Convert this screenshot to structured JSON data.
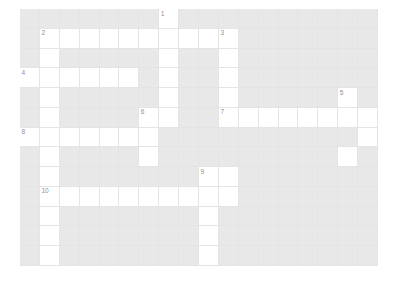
{
  "puzzle": {
    "type": "crossword-grid",
    "title": "",
    "rows": 13,
    "cols": 18,
    "cell_size_px": 19.9,
    "colors": {
      "block": "#e8e8e8",
      "open": "#ffffff",
      "gridline": "#e4e4e4",
      "number": "#8f8f8f",
      "background": "#ffffff"
    },
    "open_cells": [
      [
        0,
        7
      ],
      [
        1,
        1
      ],
      [
        1,
        2
      ],
      [
        1,
        3
      ],
      [
        1,
        4
      ],
      [
        1,
        5
      ],
      [
        1,
        6
      ],
      [
        1,
        7
      ],
      [
        1,
        8
      ],
      [
        1,
        9
      ],
      [
        1,
        10
      ],
      [
        2,
        1
      ],
      [
        2,
        7
      ],
      [
        2,
        10
      ],
      [
        3,
        0
      ],
      [
        3,
        1
      ],
      [
        3,
        2
      ],
      [
        3,
        3
      ],
      [
        3,
        4
      ],
      [
        3,
        5
      ],
      [
        3,
        7
      ],
      [
        3,
        10
      ],
      [
        4,
        1
      ],
      [
        4,
        7
      ],
      [
        4,
        10
      ],
      [
        4,
        16
      ],
      [
        5,
        1
      ],
      [
        5,
        6
      ],
      [
        5,
        7
      ],
      [
        5,
        10
      ],
      [
        5,
        11
      ],
      [
        5,
        12
      ],
      [
        5,
        13
      ],
      [
        5,
        14
      ],
      [
        5,
        15
      ],
      [
        5,
        16
      ],
      [
        5,
        17
      ],
      [
        6,
        0
      ],
      [
        6,
        1
      ],
      [
        6,
        2
      ],
      [
        6,
        3
      ],
      [
        6,
        4
      ],
      [
        6,
        5
      ],
      [
        6,
        6
      ],
      [
        6,
        17
      ],
      [
        7,
        1
      ],
      [
        7,
        6
      ],
      [
        7,
        16
      ],
      [
        8,
        1
      ],
      [
        8,
        9
      ],
      [
        8,
        10
      ],
      [
        9,
        1
      ],
      [
        9,
        2
      ],
      [
        9,
        3
      ],
      [
        9,
        4
      ],
      [
        9,
        5
      ],
      [
        9,
        6
      ],
      [
        9,
        7
      ],
      [
        9,
        8
      ],
      [
        9,
        9
      ],
      [
        9,
        10
      ],
      [
        10,
        1
      ],
      [
        10,
        9
      ],
      [
        11,
        1
      ],
      [
        11,
        9
      ],
      [
        12,
        1
      ],
      [
        12,
        9
      ]
    ],
    "clue_numbers": [
      {
        "number": "1",
        "row": 0,
        "col": 7
      },
      {
        "number": "2",
        "row": 1,
        "col": 1
      },
      {
        "number": "3",
        "row": 1,
        "col": 10
      },
      {
        "number": "4",
        "row": 3,
        "col": 0
      },
      {
        "number": "5",
        "row": 4,
        "col": 16
      },
      {
        "number": "6",
        "row": 5,
        "col": 6
      },
      {
        "number": "7",
        "row": 5,
        "col": 10
      },
      {
        "number": "8",
        "row": 6,
        "col": 0
      },
      {
        "number": "9",
        "row": 8,
        "col": 9
      },
      {
        "number": "10",
        "row": 9,
        "col": 1
      }
    ]
  }
}
